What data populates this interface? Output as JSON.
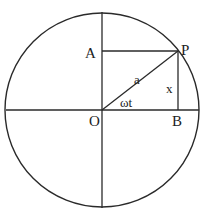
{
  "diagram": {
    "title": "",
    "labels": {
      "point_p": "P",
      "point_a": "A",
      "point_o": "O",
      "point_b": "B",
      "radius": "a",
      "height": "x",
      "angle": "ωt"
    },
    "colors": {
      "stroke": "#2a2a2a",
      "background": "#ffffff"
    }
  }
}
